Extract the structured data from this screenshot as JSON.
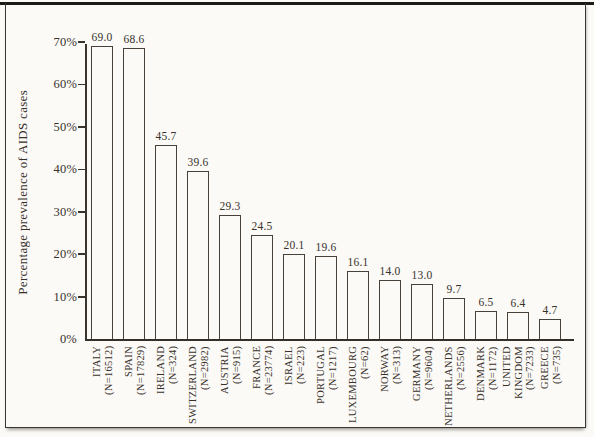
{
  "figure": {
    "background": "#fbfaf7",
    "line_color": "#3a342d",
    "text_color": "#38312a"
  },
  "chart_data": {
    "type": "bar",
    "title": "",
    "xlabel": "",
    "ylabel": "Percentage prevalence of AIDS cases",
    "ylim": [
      0,
      70
    ],
    "ytick_values": [
      0,
      10,
      20,
      30,
      40,
      50,
      60,
      70
    ],
    "ytick_labels": [
      "0%",
      "10%",
      "20%",
      "30%",
      "40%",
      "50%",
      "60%",
      "70%"
    ],
    "grid": false,
    "legend_position": "none",
    "bar_fill": "#fbfaf7",
    "bar_border": "#48413a",
    "categories": [
      {
        "name_lines": [
          "ITALY"
        ],
        "n_label": "(N=16512)"
      },
      {
        "name_lines": [
          "SPAIN"
        ],
        "n_label": "(N=17829)"
      },
      {
        "name_lines": [
          "IRELAND"
        ],
        "n_label": "(N=324)"
      },
      {
        "name_lines": [
          "SWITZERLAND"
        ],
        "n_label": "(N=2982)"
      },
      {
        "name_lines": [
          "AUSTRIA"
        ],
        "n_label": "(N=915)"
      },
      {
        "name_lines": [
          "FRANCE"
        ],
        "n_label": "(N=23774)"
      },
      {
        "name_lines": [
          "ISRAEL"
        ],
        "n_label": "(N=223)"
      },
      {
        "name_lines": [
          "PORTUGAL"
        ],
        "n_label": "(N=1217)"
      },
      {
        "name_lines": [
          "LUXEMBOURG"
        ],
        "n_label": "(N=62)"
      },
      {
        "name_lines": [
          "NORWAY"
        ],
        "n_label": "(N=313)"
      },
      {
        "name_lines": [
          "GERMANY"
        ],
        "n_label": "(N=9604)"
      },
      {
        "name_lines": [
          "NETHERLANDS"
        ],
        "n_label": "(N=2556)"
      },
      {
        "name_lines": [
          "DENMARK"
        ],
        "n_label": "(N=1172)"
      },
      {
        "name_lines": [
          "UNITED",
          "KINGDOM"
        ],
        "n_label": "(N=7233)"
      },
      {
        "name_lines": [
          "GREECE"
        ],
        "n_label": "(N=735)"
      }
    ],
    "values": [
      69.0,
      68.6,
      45.7,
      39.6,
      29.3,
      24.5,
      20.1,
      19.6,
      16.1,
      14.0,
      13.0,
      9.7,
      6.5,
      6.4,
      4.7
    ],
    "value_labels": [
      "69.0",
      "68.6",
      "45.7",
      "39.6",
      "29.3",
      "24.5",
      "20.1",
      "19.6",
      "16.1",
      "14.0",
      "13.0",
      "9.7",
      "6.5",
      "6.4",
      "4.7"
    ]
  }
}
